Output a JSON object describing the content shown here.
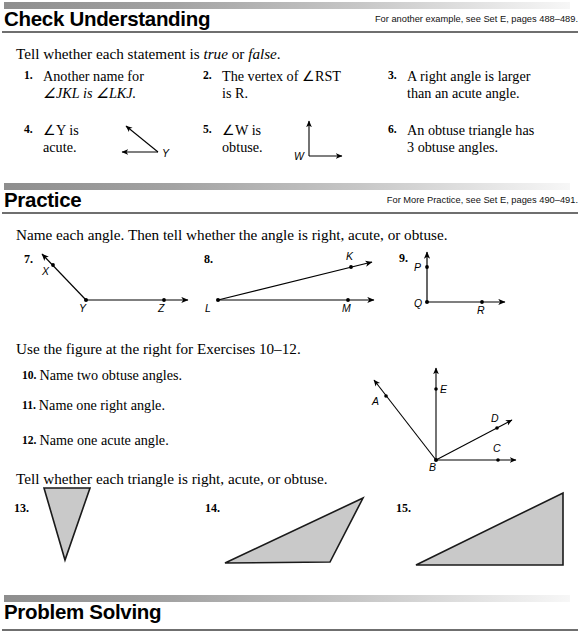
{
  "page": {
    "width": 580,
    "height": 637
  },
  "sections": {
    "check_understanding": {
      "title": "Check Understanding",
      "note": "For another example, see Set E, pages 488–489.",
      "instruction_parts": {
        "lead": "Tell whether each statement is ",
        "true_word": "true",
        "mid": " or ",
        "false_word": "false",
        "end": "."
      },
      "exercises": [
        {
          "number": "1.",
          "line1": "Another name for",
          "line2": "∠JKL is ∠LKJ."
        },
        {
          "number": "2.",
          "line1": "The vertex of ∠RST",
          "line2": "is R."
        },
        {
          "number": "3.",
          "line1": "A right angle is larger",
          "line2": "than an acute angle."
        },
        {
          "number": "4.",
          "line1": "∠Y is",
          "line2": "acute.",
          "figure": "angle-Y-obtuse-open-left",
          "figure_labels": [
            "Y"
          ]
        },
        {
          "number": "5.",
          "line1": "∠W is",
          "line2": "obtuse.",
          "figure": "angle-W-right",
          "figure_labels": [
            "W"
          ]
        },
        {
          "number": "6.",
          "line1": "An obtuse triangle has",
          "line2": "3 obtuse angles."
        }
      ]
    },
    "practice": {
      "title": "Practice",
      "note": "For More Practice, see Set E, pages 490–491.",
      "instruction_1": "Name each angle. Then tell whether the angle is right, acute, or obtuse.",
      "angle_figures": [
        {
          "number": "7.",
          "labels": [
            "X",
            "Y",
            "Z"
          ],
          "type": "obtuse-angle-XYZ"
        },
        {
          "number": "8.",
          "labels": [
            "K",
            "L",
            "M"
          ],
          "type": "acute-angle-KLM"
        },
        {
          "number": "9.",
          "labels": [
            "P",
            "Q",
            "R"
          ],
          "type": "right-angle-PQR"
        }
      ],
      "instruction_2": "Use the figure at the right for Exercises 10–12.",
      "exercises_10_12": [
        {
          "number": "10.",
          "text": "Name two obtuse angles."
        },
        {
          "number": "11.",
          "text": "Name one right angle."
        },
        {
          "number": "12.",
          "text": "Name one acute angle."
        }
      ],
      "ray_figure": {
        "name": "multi-ray-figure-ABCDE",
        "vertex_label": "B",
        "ray_labels": [
          "A",
          "E",
          "D",
          "C"
        ]
      },
      "instruction_3": "Tell whether each triangle is right, acute, or obtuse.",
      "triangle_figures": [
        {
          "number": "13.",
          "type": "inverted-narrow-triangle"
        },
        {
          "number": "14.",
          "type": "obtuse-sliver-triangle"
        },
        {
          "number": "15.",
          "type": "right-triangle"
        }
      ]
    },
    "problem_solving": {
      "title": "Problem Solving"
    }
  },
  "colors": {
    "rule": "#6f6f6f",
    "triangle_fill": "#c9c9c9",
    "triangle_stroke": "#1a1a1a",
    "ink": "#000000"
  }
}
